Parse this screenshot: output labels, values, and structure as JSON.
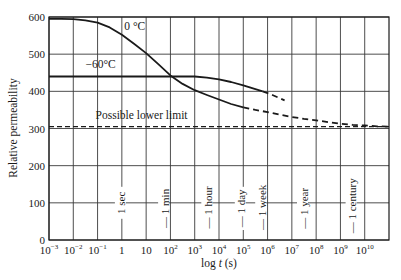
{
  "chart_data": {
    "type": "line",
    "title": "",
    "xlabel": "log t (s)",
    "ylabel": "Relative permeability",
    "xscale": "log",
    "xlim_log10": [
      -3,
      11
    ],
    "ylim": [
      0,
      600
    ],
    "grid": true,
    "legend": null,
    "x_ticks": [
      {
        "exp": -3,
        "base": "10",
        "sup": "−3"
      },
      {
        "exp": -2,
        "base": "10",
        "sup": "−2"
      },
      {
        "exp": -1,
        "base": "10",
        "sup": "−1"
      },
      {
        "exp": 0,
        "base": "1",
        "sup": ""
      },
      {
        "exp": 1,
        "base": "10",
        "sup": ""
      },
      {
        "exp": 2,
        "base": "10",
        "sup": "2"
      },
      {
        "exp": 3,
        "base": "10",
        "sup": "3"
      },
      {
        "exp": 4,
        "base": "10",
        "sup": "4"
      },
      {
        "exp": 5,
        "base": "10",
        "sup": "5"
      },
      {
        "exp": 6,
        "base": "10",
        "sup": "6"
      },
      {
        "exp": 7,
        "base": "10",
        "sup": "7"
      },
      {
        "exp": 8,
        "base": "10",
        "sup": "8"
      },
      {
        "exp": 9,
        "base": "10",
        "sup": "9"
      },
      {
        "exp": 10,
        "base": "10",
        "sup": "10"
      }
    ],
    "y_ticks": [
      0,
      100,
      200,
      300,
      400,
      500,
      600
    ],
    "series": [
      {
        "name": "0 °C",
        "label_pos": {
          "log_t": 0.1,
          "value": 565
        },
        "solid_points": [
          [
            -3,
            595
          ],
          [
            -2.5,
            595
          ],
          [
            -2,
            594
          ],
          [
            -1.5,
            591
          ],
          [
            -1,
            585
          ],
          [
            -0.5,
            572
          ],
          [
            0,
            552
          ],
          [
            0.5,
            528
          ],
          [
            1,
            503
          ],
          [
            1.5,
            473
          ],
          [
            2,
            443
          ],
          [
            2.5,
            420
          ],
          [
            3,
            403
          ],
          [
            3.5,
            390
          ],
          [
            4,
            378
          ],
          [
            4.5,
            366
          ],
          [
            5,
            357
          ]
        ],
        "dashed_points": [
          [
            5,
            357
          ],
          [
            5.5,
            350
          ],
          [
            6,
            344
          ],
          [
            6.5,
            337
          ],
          [
            7,
            331
          ],
          [
            7.5,
            326
          ],
          [
            8,
            322
          ],
          [
            8.5,
            317
          ],
          [
            9,
            313
          ],
          [
            9.5,
            310
          ],
          [
            10,
            308
          ],
          [
            10.5,
            306
          ],
          [
            11,
            305
          ]
        ]
      },
      {
        "name": "−60°C",
        "label_pos": {
          "log_t": -1.5,
          "value": 462
        },
        "solid_points": [
          [
            -3,
            440
          ],
          [
            -2,
            440
          ],
          [
            -1,
            440
          ],
          [
            0,
            440
          ],
          [
            1,
            440
          ],
          [
            2,
            440
          ],
          [
            3,
            440
          ],
          [
            3.5,
            437
          ],
          [
            4,
            432
          ],
          [
            4.5,
            425
          ],
          [
            5,
            416
          ],
          [
            5.5,
            406
          ],
          [
            5.8,
            400
          ]
        ],
        "dashed_points": [
          [
            5.8,
            400
          ],
          [
            6.2,
            390
          ],
          [
            6.7,
            376
          ]
        ]
      }
    ],
    "reference_lines": [
      {
        "name": "Possible lower limit",
        "value": 305,
        "style": "dashed",
        "label_pos": {
          "log_t": -1.0,
          "value": 330
        }
      }
    ],
    "time_markers": [
      {
        "label": "1 sec",
        "log_t": 0.0,
        "dash": false,
        "y_center_value": 100
      },
      {
        "label": "— 1 min",
        "log_t": 1.78,
        "dash": true,
        "y_center_value": 85
      },
      {
        "label": "— 1 hour",
        "log_t": 3.56,
        "dash": true,
        "y_center_value": 88
      },
      {
        "label": "— 1 day",
        "log_t": 4.94,
        "dash": true,
        "y_center_value": 85
      },
      {
        "label": "— 1 week",
        "log_t": 5.78,
        "dash": true,
        "y_center_value": 88
      },
      {
        "label": "— 1 year",
        "log_t": 7.5,
        "dash": true,
        "y_center_value": 85
      },
      {
        "label": "— 1 century",
        "log_t": 9.5,
        "dash": true,
        "y_center_value": 92
      }
    ]
  },
  "plot_frame": {
    "left": 49,
    "right": 389,
    "top": 17,
    "bottom": 240
  },
  "colors": {
    "line": "#1a1a1a",
    "grid": "#3a3a3a",
    "background": "#ffffff"
  }
}
